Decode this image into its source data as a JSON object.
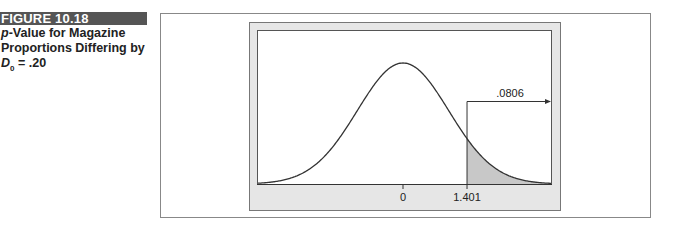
{
  "figure": {
    "label": "FIGURE 10.18",
    "caption_line1_italic": "p",
    "caption_line1": "-Value for Magazine",
    "caption_line2": "Proportions Differing by",
    "caption_var": "D",
    "caption_sub": "0",
    "caption_rest": " = .20"
  },
  "chart_data": {
    "type": "area",
    "title": "p-Value for Magazine Proportions Differing by D0 = .20",
    "distribution": "standard normal",
    "x_ticks": [
      {
        "value": 0,
        "label": "0"
      },
      {
        "value": 1.401,
        "label": "1.401"
      }
    ],
    "shaded_region": {
      "from": 1.401,
      "to": "inf",
      "area": 0.0806
    },
    "annotation": ".0806",
    "xlabel": "",
    "ylabel": "",
    "grid": false,
    "legend": false
  },
  "colors": {
    "header_bg": "#555555",
    "frame_gray": "#e6e6e6",
    "shade": "#c8c8c8",
    "line": "#333333"
  }
}
